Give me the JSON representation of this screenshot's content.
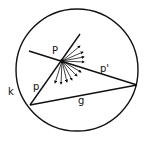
{
  "diagram": {
    "circle_label": "k",
    "point_label": "P",
    "segment_p_label": "p",
    "segment_p_prime_label": "p'",
    "chord_label": "g",
    "stroke_color": "#111111",
    "background": "#ffffff"
  }
}
